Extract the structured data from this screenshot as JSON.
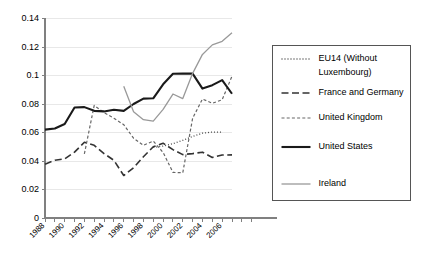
{
  "chart_data": {
    "type": "line",
    "title": "",
    "subtitle": "",
    "xlabel": "",
    "ylabel": "",
    "xlim": [
      1988,
      2007
    ],
    "ylim": [
      0,
      0.14
    ],
    "grid": true,
    "legend_position": "right",
    "y_ticks": [
      "0",
      "0.02",
      "0.04",
      "0.06",
      "0.08",
      "0.1",
      "0.12",
      "0.14"
    ],
    "y_tick_values": [
      0,
      0.02,
      0.04,
      0.06,
      0.08,
      0.1,
      0.12,
      0.14
    ],
    "x_tick_labels": [
      "1988",
      "1990",
      "1992",
      "1994",
      "1996",
      "1998",
      "2000",
      "2002",
      "2004",
      "2006"
    ],
    "x_tick_values": [
      1988,
      1990,
      1992,
      1994,
      1996,
      1998,
      2000,
      2002,
      2004,
      2006
    ],
    "x": [
      1988,
      1989,
      1990,
      1991,
      1992,
      1993,
      1994,
      1995,
      1996,
      1997,
      1998,
      1999,
      2000,
      2001,
      2002,
      2003,
      2004,
      2005,
      2006,
      2007
    ],
    "series": [
      {
        "name": "EU14 (Without Luxembourg)",
        "style": "dotted",
        "color": "#4d4d4d",
        "x": [
          1999,
          2000,
          2001,
          2002,
          2003,
          2004,
          2005,
          2006
        ],
        "values": [
          0.0495,
          0.0505,
          0.0522,
          0.0545,
          0.0572,
          0.0595,
          0.0603,
          0.0603
        ]
      },
      {
        "name": "France and Germany",
        "style": "dashed",
        "color": "#333333",
        "x": [
          1988,
          1989,
          1990,
          1991,
          1992,
          1993,
          1994,
          1995,
          1996,
          1997,
          1998,
          1999,
          2000,
          2001,
          2002,
          2003,
          2004,
          2005,
          2006,
          2007
        ],
        "values": [
          0.0378,
          0.0405,
          0.0415,
          0.0462,
          0.0532,
          0.051,
          0.0452,
          0.0405,
          0.0298,
          0.0352,
          0.043,
          0.05,
          0.0525,
          0.048,
          0.0445,
          0.0452,
          0.0462,
          0.0425,
          0.0442,
          0.0443
        ]
      },
      {
        "name": "United Kingdom",
        "style": "fine-dashed",
        "color": "#666666",
        "x": [
          1992,
          1993,
          1994,
          1995,
          1996,
          1997,
          1998,
          1999,
          2000,
          2001,
          2002,
          2003,
          2004,
          2005,
          2006,
          2007
        ],
        "values": [
          0.045,
          0.079,
          0.074,
          0.07,
          0.0655,
          0.056,
          0.051,
          0.054,
          0.046,
          0.032,
          0.0318,
          0.07,
          0.0835,
          0.0805,
          0.083,
          0.0995
        ]
      },
      {
        "name": "United States",
        "style": "solid-thick",
        "color": "#1a1a1a",
        "x": [
          1988,
          1989,
          1990,
          1991,
          1992,
          1993,
          1994,
          1995,
          1996,
          1997,
          1998,
          1999,
          2000,
          2001,
          2002,
          2003,
          2004,
          2005,
          2006,
          2007
        ],
        "values": [
          0.062,
          0.0628,
          0.066,
          0.0775,
          0.0778,
          0.0752,
          0.0748,
          0.076,
          0.0752,
          0.08,
          0.0838,
          0.084,
          0.0938,
          0.1012,
          0.1013,
          0.1013,
          0.0908,
          0.0932,
          0.0968,
          0.0872
        ]
      },
      {
        "name": "Ireland",
        "style": "solid-thin",
        "color": "#999999",
        "x": [
          1996,
          1997,
          1998,
          1999,
          2000,
          2001,
          2002,
          2003,
          2004,
          2005,
          2006,
          2007
        ],
        "values": [
          0.0925,
          0.0745,
          0.069,
          0.068,
          0.0762,
          0.087,
          0.0838,
          0.1015,
          0.1148,
          0.1215,
          0.124,
          0.13
        ]
      }
    ]
  },
  "legend": {
    "items": [
      {
        "label": "EU14 (Without",
        "label2": "Luxembourg)"
      },
      {
        "label": "France and Germany"
      },
      {
        "label": "United Kingdom"
      },
      {
        "label": "United States"
      },
      {
        "label": "Ireland"
      }
    ]
  }
}
